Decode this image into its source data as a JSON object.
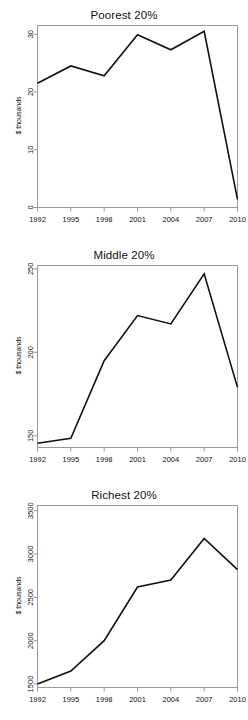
{
  "figure": {
    "panel_count": 3,
    "background_color": "#ffffff",
    "line_color": "#111111",
    "axis_color": "#9a9a9a"
  },
  "charts": [
    {
      "id": "poorest",
      "chart_type": "line",
      "title": "Poorest 20%",
      "xlabel": "",
      "ylabel": "$ thousands",
      "ylim": [
        0,
        31.5
      ],
      "xlim": [
        1992,
        2010
      ],
      "ytick_labels": [
        "0",
        "10",
        "20",
        "30"
      ],
      "ytick_values": [
        0,
        10,
        20,
        30
      ],
      "xtick_labels": [
        "1992",
        "1995",
        "1998",
        "2001",
        "2004",
        "2007",
        "2010"
      ],
      "xtick_values": [
        1992,
        1995,
        1998,
        2001,
        2004,
        2007,
        2010
      ],
      "x": [
        1992,
        1995,
        1998,
        2001,
        2004,
        2007,
        2010
      ],
      "values": [
        21.5,
        24.5,
        22.8,
        29.9,
        27.3,
        30.5,
        1.4
      ],
      "grid": false,
      "legend": false
    },
    {
      "id": "middle",
      "chart_type": "line",
      "title": "Middle 20%",
      "xlabel": "",
      "ylabel": "$ thousands",
      "ylim": [
        143,
        252
      ],
      "xlim": [
        1992,
        2010
      ],
      "ytick_labels": [
        "150",
        "200",
        "250"
      ],
      "ytick_values": [
        150,
        200,
        250
      ],
      "xtick_labels": [
        "1992",
        "1995",
        "1998",
        "2001",
        "2004",
        "2007",
        "2010"
      ],
      "xtick_values": [
        1992,
        1995,
        1998,
        2001,
        2004,
        2007,
        2010
      ],
      "x": [
        1992,
        1995,
        1998,
        2001,
        2004,
        2007,
        2010
      ],
      "values": [
        145.5,
        148.5,
        195.0,
        222.0,
        217.0,
        247.0,
        179.0
      ],
      "grid": false,
      "legend": false
    },
    {
      "id": "richest",
      "chart_type": "line",
      "title": "Richest 20%",
      "xlabel": "",
      "ylabel": "$ thousands",
      "ylim": [
        1460,
        3560
      ],
      "xlim": [
        1992,
        2010
      ],
      "ytick_labels": [
        "1500",
        "2000",
        "2500",
        "3000",
        "3500"
      ],
      "ytick_values": [
        1500,
        2000,
        2500,
        3000,
        3500
      ],
      "xtick_labels": [
        "1992",
        "1995",
        "1998",
        "2001",
        "2004",
        "2007",
        "2010"
      ],
      "xtick_values": [
        1992,
        1995,
        1998,
        2001,
        2004,
        2007,
        2010
      ],
      "x": [
        1992,
        1995,
        1998,
        2001,
        2004,
        2007,
        2010
      ],
      "values": [
        1500,
        1650,
        2000,
        2620,
        2700,
        3180,
        2820
      ],
      "grid": false,
      "legend": false
    }
  ],
  "chart_data": [
    {
      "type": "line",
      "title": "Poorest 20%",
      "categories": [
        "1992",
        "1995",
        "1998",
        "2001",
        "2004",
        "2007",
        "2010"
      ],
      "values": [
        21.5,
        24.5,
        22.8,
        29.9,
        27.3,
        30.5,
        1.4
      ],
      "xlabel": "",
      "ylabel": "$ thousands",
      "ylim": [
        0,
        31.5
      ],
      "yticks": [
        0,
        10,
        20,
        30
      ],
      "grid": false,
      "legend": false
    },
    {
      "type": "line",
      "title": "Middle 20%",
      "categories": [
        "1992",
        "1995",
        "1998",
        "2001",
        "2004",
        "2007",
        "2010"
      ],
      "values": [
        145.5,
        148.5,
        195.0,
        222.0,
        217.0,
        247.0,
        179.0
      ],
      "xlabel": "",
      "ylabel": "$ thousands",
      "ylim": [
        143,
        252
      ],
      "yticks": [
        150,
        200,
        250
      ],
      "grid": false,
      "legend": false
    },
    {
      "type": "line",
      "title": "Richest 20%",
      "categories": [
        "1992",
        "1995",
        "1998",
        "2001",
        "2004",
        "2007",
        "2010"
      ],
      "values": [
        1500,
        1650,
        2000,
        2620,
        2700,
        3180,
        2820
      ],
      "xlabel": "",
      "ylabel": "$ thousands",
      "ylim": [
        1460,
        3560
      ],
      "yticks": [
        1500,
        2000,
        2500,
        3000,
        3500
      ],
      "grid": false,
      "legend": false
    }
  ]
}
